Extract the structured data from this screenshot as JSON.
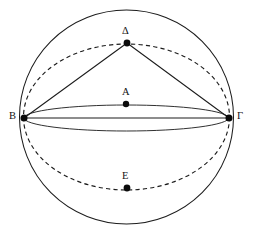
{
  "figure": {
    "kind": "geometry-diagram",
    "background_color": "#ffffff",
    "stroke_color": "#1c1c1c",
    "width": 253,
    "height": 237
  },
  "points": [
    {
      "id": "delta",
      "label": "Δ",
      "x": 127,
      "y": 43,
      "label_x": 122,
      "label_y": 26,
      "role": "top-vertex-on-tilted-circle"
    },
    {
      "id": "alpha",
      "label": "A",
      "x": 126,
      "y": 104,
      "label_x": 122,
      "label_y": 87,
      "role": "sphere-center"
    },
    {
      "id": "beta",
      "label": "B",
      "x": 24,
      "y": 118,
      "label_x": 9,
      "label_y": 111,
      "role": "left-vertex"
    },
    {
      "id": "gamma",
      "label": "Γ",
      "x": 229,
      "y": 118,
      "label_x": 237,
      "label_y": 111,
      "role": "right-vertex"
    },
    {
      "id": "epsilon",
      "label": "E",
      "x": 127,
      "y": 188,
      "label_x": 122,
      "label_y": 171,
      "role": "bottom-vertex-on-tilted-circle"
    }
  ],
  "curves": [
    {
      "id": "sphere-outline",
      "type": "circle",
      "style": "solid",
      "cx": 126.5,
      "cy": 117,
      "r": 107
    },
    {
      "id": "equator-ellipse",
      "type": "ellipse",
      "style": "solid",
      "cx": 126.5,
      "cy": 118,
      "rx": 102.5,
      "ry": 13
    },
    {
      "id": "tilted-great-circle",
      "type": "ellipse",
      "style": "dashed",
      "cx": 126.5,
      "cy": 117,
      "rx": 103,
      "ry": 73
    }
  ],
  "segments": [
    {
      "id": "chord-beta-gamma",
      "from": "beta",
      "to": "gamma",
      "style": "solid"
    },
    {
      "id": "chord-beta-delta",
      "from": "beta",
      "to": "delta",
      "style": "solid"
    },
    {
      "id": "chord-delta-gamma",
      "from": "delta",
      "to": "gamma",
      "style": "solid"
    }
  ],
  "labels": {
    "delta": "Δ",
    "alpha": "A",
    "beta": "B",
    "gamma": "Γ",
    "epsilon": "E"
  }
}
